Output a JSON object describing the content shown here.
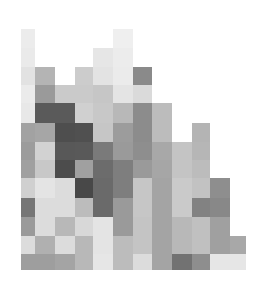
{
  "image": {
    "description": "Grayscale pixel mosaic of rectangular tiles forming an irregular skyline-like shape",
    "background": "#ffffff",
    "col_edges": [
      21,
      35,
      55,
      75,
      93,
      113,
      133,
      152,
      172,
      192,
      210,
      230,
      246
    ],
    "row_edges": [
      29,
      48,
      67,
      85,
      103,
      123,
      142,
      160,
      178,
      198,
      217,
      236,
      254,
      270
    ],
    "cells": [
      [
        "#ececec",
        null,
        null,
        null,
        null,
        "#efefef",
        null,
        null,
        null,
        null,
        null,
        null
      ],
      [
        "#eaeaea",
        null,
        null,
        null,
        "#e6e6e6",
        "#ececec",
        null,
        null,
        null,
        null,
        null,
        null
      ],
      [
        "#e2e2e2",
        "#b4b4b4",
        null,
        "#cccccc",
        "#e3e3e3",
        "#ebebeb",
        "#8a8a8a",
        null,
        null,
        null,
        null,
        null
      ],
      [
        "#ebebeb",
        "#9a9a9a",
        "#cacaca",
        "#cacaca",
        "#c6c6c6",
        "#e4e4e4",
        "#dadada",
        null,
        null,
        null,
        null,
        null
      ],
      [
        "#e8e8e8",
        "#5a5a5a",
        "#5a5a5a",
        "#d0d0d0",
        "#c8c8c8",
        "#b8b8b8",
        "#8c8c8c",
        "#bcbcbc",
        null,
        null,
        null,
        null
      ],
      [
        "#a2a2a2",
        "#a6a6a6",
        "#4e4e4e",
        "#505050",
        "#c6c6c6",
        "#9c9c9c",
        "#8c8c8c",
        "#bcbcbc",
        null,
        "#b4b4b4",
        null,
        null
      ],
      [
        "#9c9c9c",
        "#d2d2d2",
        "#585858",
        "#595959",
        "#7a7a7a",
        "#9a9a9a",
        "#8e8e8e",
        "#a8a8a8",
        "#c4c4c4",
        "#b6b6b6",
        null,
        null
      ],
      [
        "#a0a0a0",
        "#c8c8c8",
        "#4c4c4c",
        "#a0a0a0",
        "#6c6c6c",
        "#7e7e7e",
        "#9a9a9a",
        "#a6a6a6",
        "#c4c4c4",
        "#bcbcbc",
        null,
        null
      ],
      [
        "#d0d0d0",
        "#e4e4e4",
        "#dcdcdc",
        "#484848",
        "#6a6a6a",
        "#7e7e7e",
        "#c6c6c6",
        "#a4a4a4",
        "#cacaca",
        "#c2c2c2",
        "#8e8e8e",
        null
      ],
      [
        "#767676",
        "#dcdcdc",
        "#dcdcdc",
        "#bcbcbc",
        "#6a6a6a",
        "#9a9a9a",
        "#c6c6c6",
        "#a4a4a4",
        "#cacaca",
        "#828282",
        "#888888",
        null
      ],
      [
        "#9a9a9a",
        "#dcdcdc",
        "#b8b8b8",
        "#d8d8d8",
        "#e4e4e4",
        "#9a9a9a",
        "#c4c4c4",
        "#a4a4a4",
        "#b8b8b8",
        "#c0c0c0",
        "#a0a0a0",
        null
      ],
      [
        "#dcdcdc",
        "#b0b0b0",
        "#dcdcdc",
        "#b8b8b8",
        "#e4e4e4",
        "#bcbcbc",
        "#c4c4c4",
        "#a4a4a4",
        "#b8b8b8",
        "#c0c0c0",
        "#a0a0a0",
        "#a8a8a8"
      ],
      [
        "#9e9e9e",
        "#9e9e9e",
        "#a4a4a4",
        "#b8b8b8",
        "#e6e6e6",
        "#bcbcbc",
        "#dcdcdc",
        "#a4a4a4",
        "#727272",
        "#8e8e8e",
        "#e6e6e6",
        "#e6e6e6"
      ]
    ]
  }
}
